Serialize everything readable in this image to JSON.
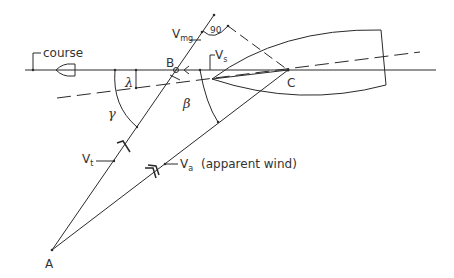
{
  "diagram": {
    "labels": {
      "course": "course",
      "point_a": "A",
      "point_b": "B",
      "point_c": "C",
      "v_mg": "V",
      "v_mg_sub": "mg",
      "v_s": "V",
      "v_s_sub": "s",
      "v_t": "V",
      "v_t_sub": "t",
      "v_a": "V",
      "v_a_sub": "a",
      "apparent_wind": "(apparent wind)",
      "right_angle": "90",
      "lambda": "λ",
      "gamma": "γ",
      "beta": "β"
    },
    "colors": {
      "stroke": "#2a2a2a",
      "text": "#333333",
      "background": "#ffffff"
    }
  }
}
